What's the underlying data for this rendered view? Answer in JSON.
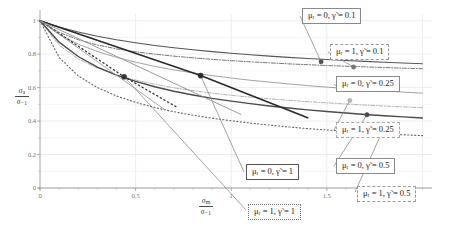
{
  "figure": {
    "background_color": "#ffffff",
    "axis_color": "#9a9a9a",
    "grid_color": "#e2e2e2"
  },
  "axes": {
    "x_label_num": "σ",
    "x_label_num_sub": "m",
    "x_label_den": "σ",
    "x_label_den_sub": "−1",
    "y_label_num": "σ",
    "y_label_num_sub": "a",
    "y_label_den": "σ",
    "y_label_den_sub": "−1",
    "x_ticks": [
      {
        "value": 0,
        "label": "0"
      },
      {
        "value": 0.5,
        "label": "0.5"
      },
      {
        "value": 1.0,
        "label": "1"
      },
      {
        "value": 1.5,
        "label": "1.5"
      }
    ],
    "x_minor_ticks": [
      0.1,
      0.2,
      0.3,
      0.4,
      0.6,
      0.7,
      0.8,
      0.9,
      1.1,
      1.2,
      1.3,
      1.4,
      1.6,
      1.7,
      1.8,
      1.9,
      2.0
    ],
    "y_ticks": [
      {
        "value": 1.0,
        "label": "1"
      },
      {
        "value": 0.9,
        "label": ""
      },
      {
        "value": 0.8,
        "label": "0.8"
      },
      {
        "value": 0.7,
        "label": ""
      },
      {
        "value": 0.6,
        "label": "0.6"
      },
      {
        "value": 0.5,
        "label": ""
      },
      {
        "value": 0.4,
        "label": "0.4"
      },
      {
        "value": 0.3,
        "label": ""
      },
      {
        "value": 0.2,
        "label": "0.2"
      },
      {
        "value": 0.1,
        "label": ""
      },
      {
        "value": 0.0,
        "label": "0"
      }
    ],
    "xlim": [
      -0.04,
      2.05
    ],
    "ylim": [
      0.0,
      1.04
    ]
  },
  "chart_data": {
    "type": "line",
    "title": "",
    "xlabel": "sigma_m / sigma_-1",
    "ylabel": "sigma_a / sigma_-1",
    "xlim": [
      0,
      2.05
    ],
    "ylim": [
      0,
      1.04
    ],
    "grid": true,
    "legend_position": "right-outside-boxes",
    "series": [
      {
        "name": "μ_r = 0, γ̃ = 0.1",
        "mu_r": 0,
        "gamma_tilde": 0.1,
        "style": "solid",
        "color": "#555555",
        "width": 1.1,
        "marker_point": [
          1.47,
          0.755
        ],
        "x": [
          0.0,
          0.1,
          0.2,
          0.3,
          0.4,
          0.5,
          0.6,
          0.7,
          0.8,
          0.9,
          1.0,
          1.1,
          1.2,
          1.3,
          1.4,
          1.5,
          1.6,
          1.7,
          1.8,
          1.9,
          2.0
        ],
        "y": [
          1.0,
          0.962,
          0.932,
          0.907,
          0.886,
          0.868,
          0.852,
          0.838,
          0.826,
          0.815,
          0.805,
          0.796,
          0.788,
          0.781,
          0.774,
          0.768,
          0.762,
          0.757,
          0.752,
          0.747,
          0.743
        ]
      },
      {
        "name": "μ_r = 1, γ̃ = 0.1",
        "mu_r": 1,
        "gamma_tilde": 0.1,
        "style": "dashdot",
        "color": "#777777",
        "width": 1.0,
        "marker_point": [
          1.64,
          0.723
        ],
        "x": [
          0.0,
          0.1,
          0.2,
          0.3,
          0.4,
          0.5,
          0.6,
          0.7,
          0.8,
          0.9,
          1.0,
          1.1,
          1.2,
          1.3,
          1.4,
          1.5,
          1.6,
          1.7,
          1.8,
          1.9,
          2.0
        ],
        "y": [
          1.0,
          0.93,
          0.886,
          0.855,
          0.832,
          0.814,
          0.8,
          0.788,
          0.778,
          0.769,
          0.761,
          0.754,
          0.748,
          0.742,
          0.737,
          0.732,
          0.728,
          0.724,
          0.72,
          0.716,
          0.713
        ]
      },
      {
        "name": "μ_r = 0, γ̃ = 0.25",
        "mu_r": 0,
        "gamma_tilde": 0.25,
        "style": "solid",
        "color": "#a3a3a3",
        "width": 1.0,
        "marker_point": [
          1.56,
          0.598
        ],
        "x": [
          0.0,
          0.1,
          0.2,
          0.3,
          0.4,
          0.5,
          0.6,
          0.7,
          0.8,
          0.9,
          1.0,
          1.1,
          1.2,
          1.3,
          1.4,
          1.5,
          1.6,
          1.7,
          1.8,
          1.9,
          2.0
        ],
        "y": [
          1.0,
          0.918,
          0.86,
          0.816,
          0.781,
          0.752,
          0.727,
          0.706,
          0.688,
          0.672,
          0.657,
          0.644,
          0.633,
          0.622,
          0.612,
          0.603,
          0.595,
          0.587,
          0.58,
          0.573,
          0.567
        ]
      },
      {
        "name": "μ_r = 1, γ̃ = 0.25",
        "mu_r": 1,
        "gamma_tilde": 0.25,
        "style": "dashdot",
        "color": "#b3b3b3",
        "width": 1.0,
        "marker_point": [
          1.62,
          0.523
        ],
        "x": [
          0.0,
          0.1,
          0.2,
          0.3,
          0.4,
          0.5,
          0.6,
          0.7,
          0.8,
          0.9,
          1.0,
          1.1,
          1.2,
          1.3,
          1.4,
          1.5,
          1.6,
          1.7,
          1.8,
          1.9,
          2.0
        ],
        "y": [
          1.0,
          0.853,
          0.772,
          0.717,
          0.676,
          0.645,
          0.62,
          0.599,
          0.582,
          0.567,
          0.554,
          0.543,
          0.533,
          0.524,
          0.516,
          0.509,
          0.502,
          0.496,
          0.49,
          0.485,
          0.48
        ]
      },
      {
        "name": "μ_r = 0, γ̃ = 0.5",
        "mu_r": 0,
        "gamma_tilde": 0.5,
        "style": "solid",
        "color": "#4a4a4a",
        "width": 1.4,
        "marker_point": [
          1.71,
          0.438
        ],
        "x": [
          0.0,
          0.1,
          0.2,
          0.3,
          0.4,
          0.5,
          0.6,
          0.7,
          0.8,
          0.9,
          1.0,
          1.1,
          1.2,
          1.3,
          1.4,
          1.5,
          1.6,
          1.7,
          1.8,
          1.9,
          2.0
        ],
        "y": [
          1.0,
          0.872,
          0.786,
          0.723,
          0.675,
          0.637,
          0.605,
          0.578,
          0.556,
          0.536,
          0.519,
          0.504,
          0.49,
          0.478,
          0.467,
          0.457,
          0.448,
          0.439,
          0.432,
          0.425,
          0.418
        ]
      },
      {
        "name": "μ_r = 1, γ̃ = 0.5",
        "mu_r": 1,
        "gamma_tilde": 0.5,
        "style": "dotted",
        "color": "#5f5f5f",
        "width": 1.1,
        "marker_point": [
          1.79,
          0.338
        ],
        "x": [
          0.0,
          0.1,
          0.2,
          0.3,
          0.4,
          0.5,
          0.6,
          0.7,
          0.8,
          0.9,
          1.0,
          1.1,
          1.2,
          1.3,
          1.4,
          1.5,
          1.6,
          1.7,
          1.8,
          1.9,
          2.0
        ],
        "y": [
          1.0,
          0.78,
          0.67,
          0.6,
          0.55,
          0.512,
          0.481,
          0.456,
          0.435,
          0.417,
          0.402,
          0.388,
          0.376,
          0.365,
          0.355,
          0.347,
          0.339,
          0.331,
          0.325,
          0.318,
          0.313
        ]
      },
      {
        "name": "μ_r = 0, γ̃ = 1",
        "mu_r": 0,
        "gamma_tilde": 1,
        "style": "solid",
        "color": "#2a2a2a",
        "width": 1.6,
        "marker_point": [
          0.84,
          0.672
        ],
        "x": [
          0.0,
          0.84,
          1.4
        ],
        "y": [
          1.0,
          0.672,
          0.42
        ],
        "note": "straight line, ends below axis"
      },
      {
        "name": "μ_r = 1, γ̃ = 1",
        "mu_r": 1,
        "gamma_tilde": 1,
        "style": "dotted",
        "color": "#333333",
        "width": 1.3,
        "marker_point": [
          0.44,
          0.665
        ],
        "x": [
          0.0,
          0.44,
          0.72
        ],
        "y": [
          1.0,
          0.665,
          0.48
        ],
        "note": "straight steep line"
      },
      {
        "name": "aux-line-a",
        "style": "solid",
        "color": "#8f8f8f",
        "width": 0.9,
        "x": [
          0.0,
          1.05
        ],
        "y": [
          1.0,
          0.44
        ]
      },
      {
        "name": "aux-line-b",
        "style": "solid",
        "color": "#9c9c9c",
        "width": 0.9,
        "x": [
          0.0,
          0.65
        ],
        "y": [
          1.0,
          0.47
        ]
      }
    ]
  },
  "legend": [
    {
      "id": "legend-mu0-g01",
      "mu_label": "μ",
      "mu_sub": "r",
      "mu_value": "0",
      "gamma_label": "γ̃",
      "gamma_value": "0.1",
      "text": "μᵣ = 0, γ̃ = 0.1",
      "box_style": "solid",
      "x": 302,
      "y": 8
    },
    {
      "id": "legend-mu1-g01",
      "text": "μᵣ = 1, γ̃ = 0.1",
      "box_style": "dashed",
      "x": 330,
      "y": 44
    },
    {
      "id": "legend-mu0-g025",
      "text": "μᵣ = 0, γ̃ = 0.25",
      "box_style": "solid",
      "x": 336,
      "y": 76
    },
    {
      "id": "legend-mu1-g025",
      "text": "μᵣ = 1, γ̃ = 0.25",
      "box_style": "dashdot",
      "x": 336,
      "y": 122
    },
    {
      "id": "legend-mu0-g05",
      "text": "μᵣ = 0, γ̃ = 0.5",
      "box_style": "solid",
      "x": 336,
      "y": 158
    },
    {
      "id": "legend-mu1-g05",
      "text": "μᵣ = 1, γ̃ = 0.5",
      "box_style": "dashed",
      "x": 357,
      "y": 186
    },
    {
      "id": "legend-mu0-g1",
      "text": "μᵣ = 0, γ̃ = 1",
      "box_style": "solid-thick",
      "x": 246,
      "y": 164
    },
    {
      "id": "legend-mu1-g1",
      "text": "μᵣ = 1, γ̃ = 1",
      "box_style": "dotted",
      "x": 248,
      "y": 204
    }
  ],
  "leader_lines": [
    {
      "name": "leader-mu0-g01",
      "from": [
        1.47,
        0.755
      ],
      "to_px": [
        300,
        16
      ]
    },
    {
      "name": "leader-mu1-g01",
      "from": [
        1.64,
        0.723
      ],
      "to_px": [
        328,
        52
      ]
    },
    {
      "name": "leader-mu0-g025",
      "from": [
        1.56,
        0.598
      ],
      "to_px": [
        334,
        84
      ]
    },
    {
      "name": "leader-mu1-g025",
      "from": [
        1.62,
        0.523
      ],
      "to_px": [
        334,
        130
      ]
    },
    {
      "name": "leader-mu0-g05",
      "from": [
        1.71,
        0.438
      ],
      "to_px": [
        334,
        166
      ]
    },
    {
      "name": "leader-mu1-g05",
      "from": [
        1.79,
        0.338
      ],
      "to_px": [
        355,
        192
      ]
    },
    {
      "name": "leader-mu0-g1",
      "from": [
        0.84,
        0.672
      ],
      "to_px": [
        244,
        172
      ]
    },
    {
      "name": "leader-mu1-g1",
      "from": [
        0.44,
        0.665
      ],
      "to_px": [
        246,
        210
      ]
    }
  ]
}
